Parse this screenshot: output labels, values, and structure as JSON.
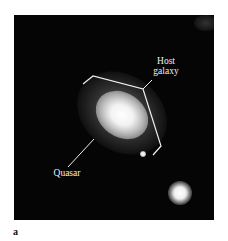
{
  "figure": {
    "panel_label": "a",
    "labels": {
      "host_line1": "Host",
      "host_line2": "galaxy",
      "quasar": "Quasar"
    },
    "colors": {
      "background": "#050505",
      "annotation": "#f0f0f0",
      "page": "#ffffff"
    }
  }
}
